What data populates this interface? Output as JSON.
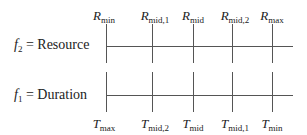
{
  "axes": [
    {
      "id": "f2",
      "symbol": "f",
      "subscript": "2",
      "equals": " = ",
      "name": "Resource",
      "label_position": "top",
      "ticks": [
        {
          "sym": "R",
          "sub": "min"
        },
        {
          "sym": "R",
          "sub": "mid,1"
        },
        {
          "sym": "R",
          "sub": "mid"
        },
        {
          "sym": "R",
          "sub": "mid,2"
        },
        {
          "sym": "R",
          "sub": "max"
        }
      ]
    },
    {
      "id": "f1",
      "symbol": "f",
      "subscript": "1",
      "equals": " = ",
      "name": "Duration",
      "label_position": "bottom",
      "ticks": [
        {
          "sym": "T",
          "sub": "max"
        },
        {
          "sym": "T",
          "sub": "mid,2"
        },
        {
          "sym": "T",
          "sub": "mid"
        },
        {
          "sym": "T",
          "sub": "mid,1"
        },
        {
          "sym": "T",
          "sub": "min"
        }
      ]
    }
  ],
  "colors": {
    "line": "#555555",
    "text": "#222222"
  }
}
